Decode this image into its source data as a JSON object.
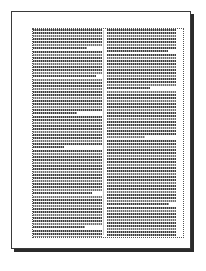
{
  "document_preview": {
    "page_label": "page-thumbnail",
    "colors": {
      "page_background": "#ffffff",
      "page_border": "#3a3a3a",
      "page_shadow": "#2b2b2b",
      "text_frame_border": "#555555",
      "text_dark": "#3d3d3d",
      "text_light": "#9a9a9a",
      "gutter_rule": "#c9c9c9",
      "image_block_border": "#2f2f2f",
      "image_block_fill": "#4b4b4b"
    },
    "layout": {
      "columns": 2,
      "column_width_px": 69,
      "gutter_px": 5,
      "page_width_px": 180,
      "page_height_px": 238,
      "text_frame_width_px": 152,
      "text_frame_height_px": 210
    },
    "image_placeholder": {
      "name": "image-frame",
      "column": "right",
      "position": "bottom"
    },
    "left_column": {
      "name": "left-text-column",
      "paragraphs": [
        {
          "lines": [
            100,
            100,
            100,
            100,
            100,
            100,
            78
          ]
        },
        {
          "lines": [
            100,
            100,
            100,
            100,
            100,
            100,
            100,
            100,
            92
          ]
        },
        {
          "lines": [
            100,
            100,
            100,
            100,
            100,
            100,
            100,
            100,
            100,
            100,
            100,
            64
          ]
        },
        {
          "lines": [
            100,
            100,
            100,
            100,
            100,
            100,
            100,
            100,
            100,
            100,
            45
          ]
        },
        {
          "lines": [
            100,
            100,
            100,
            100,
            100,
            100,
            100,
            100,
            100,
            100,
            100,
            100,
            100,
            100,
            86
          ]
        },
        {
          "lines": [
            100,
            100,
            100,
            100,
            100,
            100,
            100,
            100,
            100,
            100,
            75
          ]
        },
        {
          "lines": [
            100,
            100,
            100,
            100,
            100,
            100,
            100,
            100,
            100,
            100,
            100,
            100,
            100,
            100,
            100,
            30
          ]
        },
        {
          "lines": [
            100,
            100,
            100,
            100,
            100,
            100,
            100,
            100,
            88
          ]
        }
      ]
    },
    "right_column": {
      "name": "right-text-column",
      "paragraphs": [
        {
          "lines": [
            100,
            100,
            100,
            100,
            100,
            100,
            100,
            88
          ]
        },
        {
          "lines": [
            100,
            100,
            100,
            100,
            100,
            100,
            100,
            100,
            100,
            100,
            100,
            63
          ]
        },
        {
          "lines": [
            100,
            100,
            100,
            100,
            100,
            100,
            100,
            100,
            100,
            100,
            100,
            100,
            100,
            100,
            100,
            55
          ]
        },
        {
          "lines": [
            100,
            100,
            100,
            100,
            100,
            100,
            100,
            100,
            100,
            100,
            100,
            100,
            100,
            100,
            100,
            100,
            100,
            100,
            100,
            100,
            100,
            90
          ]
        },
        {
          "lines": [
            100,
            100,
            100,
            100,
            100,
            100,
            100,
            100,
            100,
            100,
            100,
            100,
            100,
            100,
            100,
            100,
            100,
            100,
            72
          ]
        },
        {
          "lines": [
            100,
            100,
            100,
            100,
            100,
            100,
            100,
            100,
            58
          ]
        }
      ]
    }
  }
}
